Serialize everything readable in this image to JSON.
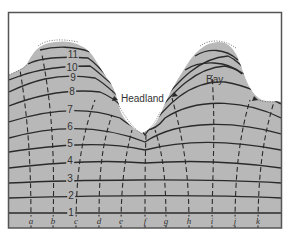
{
  "diagram": {
    "colors": {
      "water": "#b8b8b8",
      "land": "#ffffff",
      "frame": "#555555",
      "crest_line": "#2a2a2a",
      "orthogonal_line": "#2a2a2a",
      "text": "#333333"
    },
    "features": {
      "headland": "Headland",
      "bay": "Bay"
    },
    "wave_crests": [
      {
        "label": "1",
        "x": 71,
        "y": 213
      },
      {
        "label": "2",
        "x": 71,
        "y": 196
      },
      {
        "label": "3",
        "x": 70,
        "y": 179
      },
      {
        "label": "4",
        "x": 70,
        "y": 161
      },
      {
        "label": "5",
        "x": 70,
        "y": 144
      },
      {
        "label": "6",
        "x": 70,
        "y": 127
      },
      {
        "label": "7",
        "x": 70,
        "y": 110
      },
      {
        "label": "8",
        "x": 72,
        "y": 92
      },
      {
        "label": "9",
        "x": 73,
        "y": 78
      },
      {
        "label": "10",
        "x": 72,
        "y": 68
      },
      {
        "label": "11",
        "x": 73,
        "y": 55
      }
    ],
    "orthogonals": [
      {
        "label": "a",
        "x": 31
      },
      {
        "label": "b",
        "x": 53
      },
      {
        "label": "c",
        "x": 76
      },
      {
        "label": "d",
        "x": 99
      },
      {
        "label": "e",
        "x": 121
      },
      {
        "label": "f",
        "x": 145
      },
      {
        "label": "g",
        "x": 166
      },
      {
        "label": "h",
        "x": 189
      },
      {
        "label": "i",
        "x": 212
      },
      {
        "label": "j",
        "x": 235
      },
      {
        "label": "k",
        "x": 258
      }
    ]
  }
}
